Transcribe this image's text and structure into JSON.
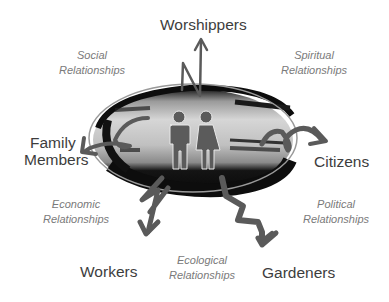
{
  "diagram": {
    "center": {
      "icon": "man-and-woman-icon",
      "shape": "brush-stroke-oval"
    },
    "roles": [
      {
        "id": "worshippers",
        "label": "Worshippers"
      },
      {
        "id": "family",
        "label_line1": "Family",
        "label_line2": "Members"
      },
      {
        "id": "citizens",
        "label": "Citizens"
      },
      {
        "id": "workers",
        "label": "Workers"
      },
      {
        "id": "gardeners",
        "label": "Gardeners"
      }
    ],
    "relationships": [
      {
        "id": "social",
        "line1": "Social",
        "line2": "Relationships"
      },
      {
        "id": "spiritual",
        "line1": "Spiritual",
        "line2": "Relationships"
      },
      {
        "id": "economic",
        "line1": "Economic",
        "line2": "Relationships"
      },
      {
        "id": "political",
        "line1": "Political",
        "line2": "Relationships"
      },
      {
        "id": "ecological",
        "line1": "Ecological",
        "line2": "Relationships"
      }
    ],
    "colors": {
      "arrow": "#5a5a5a",
      "role_text": "#3d3d3d",
      "relationship_text": "#7a7a7a",
      "icon": "#5b5b5b",
      "oval_dark": "#111111",
      "oval_light": "#c8c8c8"
    }
  }
}
